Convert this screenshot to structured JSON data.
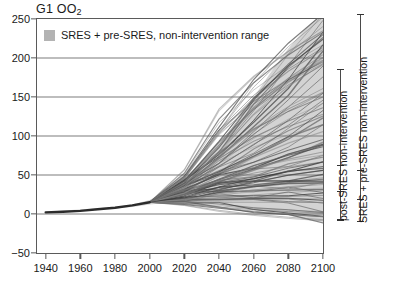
{
  "chart": {
    "title_main": "G1 OO",
    "title_sub": "2",
    "legend": {
      "swatch_name": "legend-swatch",
      "label": "SRES + pre-SRES, non-intervention range",
      "color": "#b3b3b3"
    },
    "right_ranges": [
      {
        "label": "post-SRES non-intervention",
        "low": -8,
        "high": 185,
        "ticks": [
          -8,
          28,
          62,
          185
        ]
      },
      {
        "label": "SRES + pre-SRES non-intervention",
        "low": -10,
        "high": 255,
        "ticks": [
          -10,
          18,
          55,
          255
        ]
      }
    ]
  },
  "chart_data": {
    "type": "line",
    "title": "G1 OO2",
    "xlabel": "",
    "ylabel": "",
    "xlim": [
      1935,
      2100
    ],
    "ylim": [
      -50,
      250
    ],
    "xticks": [
      1940,
      1960,
      1980,
      2000,
      2020,
      2040,
      2060,
      2080,
      2100
    ],
    "yticks": [
      -50,
      0,
      50,
      100,
      150,
      200,
      250
    ],
    "gridlines_y": [
      0,
      50,
      100,
      150,
      200
    ],
    "grid": true,
    "legend_position": "top-left-inside",
    "band": {
      "name": "SRES + pre-SRES, non-intervention range",
      "color": "#b8b8b8",
      "x": [
        1940,
        1980,
        1990,
        2000,
        2010,
        2020,
        2030,
        2040,
        2050,
        2060,
        2070,
        2080,
        2090,
        2100
      ],
      "upper": [
        3,
        9,
        12,
        18,
        30,
        46,
        66,
        90,
        118,
        150,
        182,
        212,
        238,
        258
      ],
      "lower": [
        1,
        7,
        9,
        12,
        14,
        14,
        13,
        11,
        8,
        5,
        2,
        -2,
        -6,
        -10
      ]
    },
    "series": [
      {
        "name": "historical",
        "x": [
          1940,
          1950,
          1960,
          1970,
          1980,
          1990,
          2000
        ],
        "values": [
          2,
          3,
          4,
          6,
          8,
          11,
          15
        ]
      },
      {
        "name": "scenario-01",
        "x": [
          2000,
          2020,
          2040,
          2060,
          2080,
          2100
        ],
        "values": [
          15,
          44,
          84,
          134,
          192,
          250
        ]
      },
      {
        "name": "scenario-02",
        "x": [
          2000,
          2020,
          2040,
          2060,
          2080,
          2100
        ],
        "values": [
          15,
          42,
          78,
          122,
          174,
          232
        ]
      },
      {
        "name": "scenario-03",
        "x": [
          2000,
          2020,
          2040,
          2060,
          2080,
          2100
        ],
        "values": [
          15,
          40,
          72,
          110,
          155,
          205
        ]
      },
      {
        "name": "scenario-04",
        "x": [
          2000,
          2020,
          2040,
          2060,
          2080,
          2100
        ],
        "values": [
          15,
          38,
          66,
          98,
          135,
          176
        ]
      },
      {
        "name": "scenario-05",
        "x": [
          2000,
          2020,
          2040,
          2060,
          2080,
          2100
        ],
        "values": [
          15,
          37,
          62,
          90,
          122,
          158
        ]
      },
      {
        "name": "scenario-06",
        "x": [
          2000,
          2020,
          2040,
          2060,
          2080,
          2100
        ],
        "values": [
          15,
          35,
          57,
          81,
          108,
          138
        ]
      },
      {
        "name": "scenario-07",
        "x": [
          2000,
          2020,
          2040,
          2060,
          2080,
          2100
        ],
        "values": [
          15,
          34,
          54,
          75,
          98,
          124
        ]
      },
      {
        "name": "scenario-08",
        "x": [
          2000,
          2020,
          2040,
          2060,
          2080,
          2100
        ],
        "values": [
          15,
          33,
          51,
          70,
          90,
          112
        ]
      },
      {
        "name": "scenario-09",
        "x": [
          2000,
          2020,
          2040,
          2060,
          2080,
          2100
        ],
        "values": [
          15,
          32,
          48,
          65,
          82,
          100
        ]
      },
      {
        "name": "scenario-10",
        "x": [
          2000,
          2020,
          2040,
          2060,
          2080,
          2100
        ],
        "values": [
          15,
          31,
          46,
          61,
          76,
          92
        ]
      },
      {
        "name": "scenario-11",
        "x": [
          2000,
          2020,
          2040,
          2060,
          2080,
          2100
        ],
        "values": [
          15,
          30,
          44,
          57,
          70,
          84
        ]
      },
      {
        "name": "scenario-12",
        "x": [
          2000,
          2020,
          2040,
          2060,
          2080,
          2100
        ],
        "values": [
          15,
          29,
          42,
          54,
          65,
          76
        ]
      },
      {
        "name": "scenario-13",
        "x": [
          2000,
          2020,
          2040,
          2060,
          2080,
          2100
        ],
        "values": [
          15,
          28,
          40,
          50,
          60,
          70
        ]
      },
      {
        "name": "scenario-14",
        "x": [
          2000,
          2020,
          2040,
          2060,
          2080,
          2100
        ],
        "values": [
          15,
          27,
          38,
          47,
          55,
          63
        ]
      },
      {
        "name": "scenario-15",
        "x": [
          2000,
          2020,
          2040,
          2060,
          2080,
          2100
        ],
        "values": [
          15,
          26,
          36,
          44,
          51,
          57
        ]
      },
      {
        "name": "scenario-16",
        "x": [
          2000,
          2020,
          2040,
          2060,
          2080,
          2100
        ],
        "values": [
          15,
          25,
          34,
          41,
          47,
          52
        ]
      },
      {
        "name": "scenario-17",
        "x": [
          2000,
          2020,
          2040,
          2060,
          2080,
          2100
        ],
        "values": [
          15,
          24,
          32,
          38,
          43,
          46
        ]
      },
      {
        "name": "scenario-18",
        "x": [
          2000,
          2020,
          2040,
          2060,
          2080,
          2100
        ],
        "values": [
          15,
          23,
          30,
          35,
          39,
          41
        ]
      },
      {
        "name": "scenario-19",
        "x": [
          2000,
          2020,
          2040,
          2060,
          2080,
          2100
        ],
        "values": [
          15,
          22,
          28,
          32,
          35,
          36
        ]
      },
      {
        "name": "scenario-20",
        "x": [
          2000,
          2020,
          2040,
          2060,
          2080,
          2100
        ],
        "values": [
          15,
          21,
          26,
          29,
          31,
          31
        ]
      },
      {
        "name": "scenario-21",
        "x": [
          2000,
          2020,
          2040,
          2060,
          2080,
          2100
        ],
        "values": [
          15,
          20,
          24,
          26,
          27,
          26
        ]
      },
      {
        "name": "scenario-22",
        "x": [
          2000,
          2020,
          2040,
          2060,
          2080,
          2100
        ],
        "values": [
          15,
          19,
          22,
          23,
          23,
          21
        ]
      },
      {
        "name": "scenario-23",
        "x": [
          2000,
          2020,
          2040,
          2060,
          2080,
          2100
        ],
        "values": [
          15,
          18,
          20,
          20,
          19,
          16
        ]
      },
      {
        "name": "scenario-24",
        "x": [
          2000,
          2020,
          2040,
          2060,
          2080,
          2100
        ],
        "values": [
          15,
          17,
          18,
          17,
          15,
          11
        ]
      },
      {
        "name": "scenario-25",
        "x": [
          2000,
          2020,
          2040,
          2060,
          2080,
          2100
        ],
        "values": [
          15,
          16,
          16,
          14,
          11,
          6
        ]
      },
      {
        "name": "scenario-26",
        "x": [
          2000,
          2020,
          2040,
          2060,
          2080,
          2100
        ],
        "values": [
          15,
          15,
          14,
          11,
          7,
          1
        ]
      },
      {
        "name": "scenario-27",
        "x": [
          2000,
          2020,
          2040,
          2060,
          2080,
          2100
        ],
        "values": [
          15,
          14,
          12,
          8,
          3,
          -4
        ]
      },
      {
        "name": "scenario-28",
        "x": [
          2000,
          2020,
          2040,
          2060,
          2080,
          2100
        ],
        "values": [
          15,
          13,
          10,
          5,
          -1,
          -8
        ]
      },
      {
        "name": "scenario-29",
        "x": [
          2000,
          2020,
          2040,
          2060,
          2080,
          2100
        ],
        "values": [
          15,
          45,
          90,
          145,
          205,
          258
        ]
      },
      {
        "name": "scenario-30",
        "x": [
          2000,
          2020,
          2040,
          2060,
          2080,
          2100
        ],
        "values": [
          15,
          41,
          75,
          115,
          162,
          214
        ]
      },
      {
        "name": "scenario-31",
        "x": [
          2000,
          2020,
          2040,
          2060,
          2080,
          2100
        ],
        "values": [
          15,
          36,
          60,
          86,
          115,
          148
        ]
      },
      {
        "name": "scenario-32",
        "x": [
          2000,
          2020,
          2040,
          2060,
          2080,
          2100
        ],
        "values": [
          15,
          33,
          53,
          73,
          95,
          118
        ]
      },
      {
        "name": "scenario-33",
        "x": [
          2000,
          2020,
          2040,
          2060,
          2080,
          2100
        ],
        "values": [
          15,
          30,
          45,
          59,
          73,
          88
        ]
      },
      {
        "name": "scenario-34",
        "x": [
          2000,
          2020,
          2040,
          2060,
          2080,
          2100
        ],
        "values": [
          15,
          27,
          37,
          46,
          53,
          60
        ]
      },
      {
        "name": "scenario-35",
        "x": [
          2000,
          2020,
          2040,
          2060,
          2080,
          2100
        ],
        "values": [
          15,
          24,
          31,
          36,
          40,
          42
        ]
      },
      {
        "name": "scenario-36",
        "x": [
          2000,
          2020,
          2040,
          2060,
          2080,
          2100
        ],
        "values": [
          15,
          20,
          23,
          25,
          25,
          23
        ]
      },
      {
        "name": "scenario-37",
        "x": [
          2000,
          2020,
          2040,
          2060,
          2080,
          2100
        ],
        "values": [
          15,
          39,
          69,
          104,
          145,
          188
        ]
      },
      {
        "name": "scenario-38",
        "x": [
          2000,
          2020,
          2040,
          2060,
          2080,
          2100
        ],
        "values": [
          15,
          34,
          56,
          79,
          103,
          130
        ]
      },
      {
        "name": "scenario-39",
        "x": [
          2000,
          2020,
          2040,
          2060,
          2080,
          2100
        ],
        "values": [
          15,
          28,
          41,
          52,
          62,
          72
        ]
      },
      {
        "name": "scenario-40",
        "x": [
          2000,
          2020,
          2040,
          2060,
          2080,
          2100
        ],
        "values": [
          15,
          22,
          27,
          30,
          31,
          30
        ]
      }
    ]
  }
}
